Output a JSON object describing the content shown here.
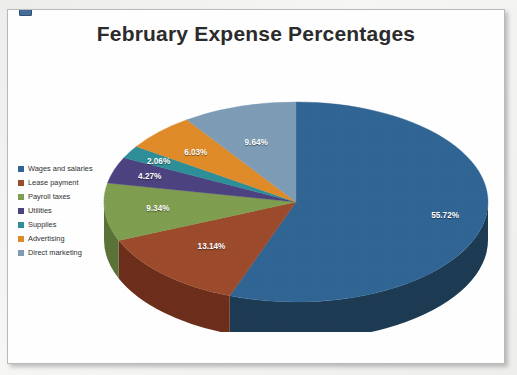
{
  "document": {
    "background_color": "#f2f2f0",
    "card_background": "#ffffff",
    "border_color": "#b9b9b9"
  },
  "chart_data": {
    "type": "pie",
    "title": "February Expense Percentages",
    "xlabel": "",
    "ylabel": "",
    "legend_position": "left",
    "three_d": true,
    "unit": "%",
    "categories": [
      "Wages and salaries",
      "Lease payment",
      "Payroll taxes",
      "Utilities",
      "Supplies",
      "Advertising",
      "Direct marketing"
    ],
    "values": [
      55.72,
      13.14,
      9.34,
      4.27,
      2.06,
      6.03,
      9.64
    ],
    "labels": [
      "55.72%",
      "13.14%",
      "9.34%",
      "4.27%",
      "2.06%",
      "6.03%",
      "9.64%"
    ],
    "colors": [
      "#2f6494",
      "#9c4a2b",
      "#7f9e4f",
      "#4c4280",
      "#2e8f99",
      "#e08b28",
      "#7d9cb6"
    ],
    "side_colors": [
      "#1d3a53",
      "#6c2e1b",
      "#5a7238",
      "#342c58",
      "#1f6268",
      "#a46118",
      "#5a7287"
    ],
    "slices": [
      {
        "label": "Wages and salaries",
        "value": 55.72,
        "display": "55.72%",
        "color": "#2f6494"
      },
      {
        "label": "Lease payment",
        "value": 13.14,
        "display": "13.14%",
        "color": "#9c4a2b"
      },
      {
        "label": "Payroll taxes",
        "value": 9.34,
        "display": "9.34%",
        "color": "#7f9e4f"
      },
      {
        "label": "Utilities",
        "value": 4.27,
        "display": "4.27%",
        "color": "#4c4280"
      },
      {
        "label": "Supplies",
        "value": 2.06,
        "display": "2.06%",
        "color": "#2e8f99"
      },
      {
        "label": "Advertising",
        "value": 6.03,
        "display": "6.03%",
        "color": "#e08b28"
      },
      {
        "label": "Direct marketing",
        "value": 9.64,
        "display": "9.64%",
        "color": "#7d9cb6"
      }
    ]
  },
  "legend": {
    "items": [
      {
        "label": "Wages and salaries",
        "color": "#2f6494"
      },
      {
        "label": "Lease payment",
        "color": "#9c4a2b"
      },
      {
        "label": "Payroll taxes",
        "color": "#7f9e4f"
      },
      {
        "label": "Utilities",
        "color": "#4c4280"
      },
      {
        "label": "Supplies",
        "color": "#2e8f99"
      },
      {
        "label": "Advertising",
        "color": "#e08b28"
      },
      {
        "label": "Direct marketing",
        "color": "#7d9cb6"
      }
    ]
  }
}
